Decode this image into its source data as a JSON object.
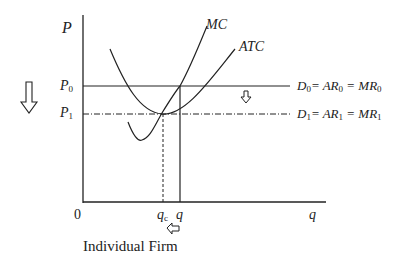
{
  "diagram": {
    "title": "Individual Firm",
    "axes": {
      "y_label": "P",
      "x_label": "q",
      "origin_label": "0"
    },
    "price_levels": [
      {
        "label": "P",
        "sub": "0",
        "style": "solid"
      },
      {
        "label": "P",
        "sub": "1",
        "style": "dash-dot"
      }
    ],
    "curves": [
      {
        "name": "MC"
      },
      {
        "name": "ATC"
      }
    ],
    "demand_lines": [
      {
        "text_d": "D",
        "sub_d": "0",
        "text_ar": "= AR",
        "sub_ar": "0",
        "text_mr": "= MR",
        "sub_mr": "0"
      },
      {
        "text_d": "D",
        "sub_d": "1",
        "text_ar": "= AR",
        "sub_ar": "1",
        "text_mr": "= MR",
        "sub_mr": "1"
      }
    ],
    "quantity_marks": [
      {
        "label": "q",
        "sub": "c",
        "style": "dotted"
      },
      {
        "label": "q",
        "sub": "",
        "style": "solid"
      }
    ],
    "arrows": [
      {
        "name": "price-down-arrow-left"
      },
      {
        "name": "demand-shift-down-arrow"
      },
      {
        "name": "quantity-left-arrow"
      }
    ]
  }
}
